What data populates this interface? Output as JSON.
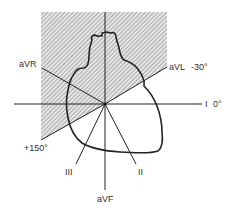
{
  "figure": {
    "shaded_region": "Axis range from -30° to +150° (counter-clockwise, through aVR)",
    "colors": {
      "line": "#222222",
      "hatch": "#888888",
      "background": "#ffffff",
      "text": "#333333"
    }
  },
  "leads": [
    {
      "id": "I",
      "label": "I",
      "angle_label": "0°",
      "angle_deg": 0
    },
    {
      "id": "aVL",
      "label": "aVL",
      "angle_label": "-30°",
      "angle_deg": -30
    },
    {
      "id": "aVR",
      "label": "aVR",
      "angle_label": "",
      "angle_deg": -150
    },
    {
      "id": "II",
      "label": "II",
      "angle_label": "",
      "angle_deg": 60
    },
    {
      "id": "III",
      "label": "III",
      "angle_label": "",
      "angle_deg": 120
    },
    {
      "id": "aVF",
      "label": "aVF",
      "angle_label": "",
      "angle_deg": 90
    }
  ],
  "labels": {
    "aVR": "aVR",
    "aVL": "aVL",
    "aVL_angle": "-30°",
    "I": "I",
    "I_angle": "0°",
    "plus150": "+150°",
    "III": "III",
    "II": "II",
    "aVF": "aVF"
  }
}
